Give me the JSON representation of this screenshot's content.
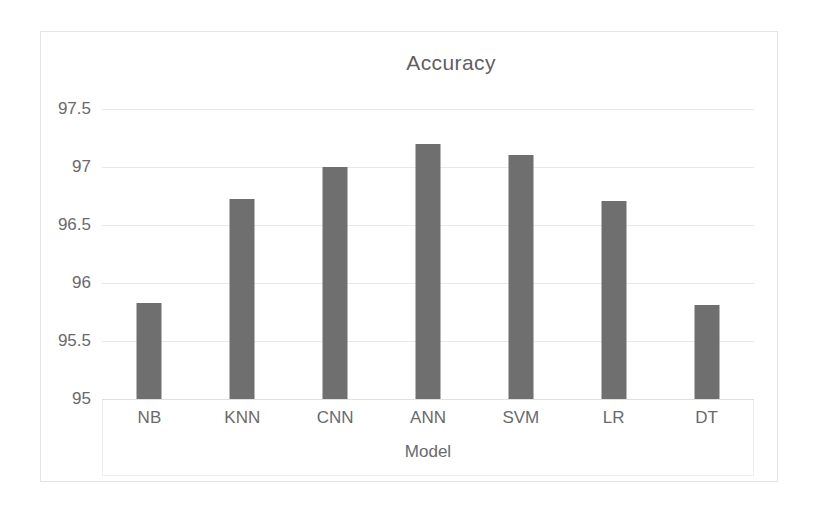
{
  "chart_data": {
    "type": "bar",
    "title": "Accuracy",
    "xlabel": "Model",
    "ylabel": "",
    "categories": [
      "NB",
      "KNN",
      "CNN",
      "ANN",
      "SVM",
      "LR",
      "DT"
    ],
    "values": [
      95.83,
      96.72,
      97.0,
      97.2,
      97.1,
      96.71,
      95.81
    ],
    "series": [
      {
        "name": "Accuracy",
        "values": [
          95.83,
          96.72,
          97.0,
          97.2,
          97.1,
          96.71,
          95.81
        ]
      }
    ],
    "ylim": [
      95,
      97.5
    ],
    "ytick_labels": [
      "97.5",
      "97",
      "96.5",
      "96",
      "95.5",
      "95"
    ],
    "ytick_values": [
      97.5,
      97,
      96.5,
      96,
      95.5,
      95
    ],
    "grid": true,
    "legend": false,
    "legend_position": "none",
    "colors": {
      "bar": "#6f6f6f",
      "gridline": "#e9e9e9",
      "border": "#e4e4e4",
      "text": "#6a6a6a",
      "title_text": "#5f5f5f",
      "background": "#ffffff"
    }
  }
}
